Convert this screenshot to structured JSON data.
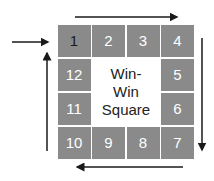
{
  "diagram": {
    "title_lines": [
      "Win-",
      "Win",
      "Square"
    ],
    "cells": [
      {
        "label": "1",
        "col": 0,
        "row": 0,
        "dark_text": true
      },
      {
        "label": "2",
        "col": 1,
        "row": 0
      },
      {
        "label": "3",
        "col": 2,
        "row": 0
      },
      {
        "label": "4",
        "col": 3,
        "row": 0
      },
      {
        "label": "5",
        "col": 3,
        "row": 1
      },
      {
        "label": "6",
        "col": 3,
        "row": 2
      },
      {
        "label": "7",
        "col": 3,
        "row": 3
      },
      {
        "label": "8",
        "col": 2,
        "row": 3
      },
      {
        "label": "9",
        "col": 1,
        "row": 3
      },
      {
        "label": "10",
        "col": 0,
        "row": 3
      },
      {
        "label": "11",
        "col": 0,
        "row": 2
      },
      {
        "label": "12",
        "col": 0,
        "row": 1
      }
    ],
    "colors": {
      "cell": "#8a8a8a",
      "cell_text": "#ffffff",
      "arrow": "#1a1a1a"
    },
    "arrows": [
      {
        "name": "entry-arrow",
        "direction": "right"
      },
      {
        "name": "top-arrow",
        "direction": "right"
      },
      {
        "name": "right-arrow",
        "direction": "down"
      },
      {
        "name": "bottom-arrow",
        "direction": "left"
      },
      {
        "name": "left-arrow",
        "direction": "up"
      }
    ]
  }
}
